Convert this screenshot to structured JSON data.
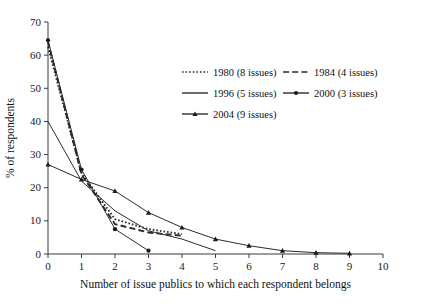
{
  "chart_data": {
    "type": "line",
    "title": "",
    "xlabel": "Number of issue publics to which each respondent belongs",
    "ylabel": "% of respondents",
    "xlim": [
      0,
      10
    ],
    "ylim": [
      0,
      70
    ],
    "xticks": [
      "0",
      "1",
      "2",
      "3",
      "4",
      "5",
      "6",
      "7",
      "8",
      "9",
      "10"
    ],
    "yticks": [
      "0",
      "10",
      "20",
      "30",
      "40",
      "50",
      "60",
      "70"
    ],
    "grid": false,
    "legend_position": "upper-center",
    "series": [
      {
        "name": "1980 (8 issues)",
        "label_year": "1980",
        "label_issues": "(8 issues)",
        "style": "dotted",
        "marker": "none",
        "color": "#2b2b2b",
        "x": [
          0,
          1,
          2,
          3,
          4
        ],
        "values": [
          62.5,
          24.5,
          10.5,
          7.5,
          6.0
        ]
      },
      {
        "name": "1984 (4 issues)",
        "label_year": "1984",
        "label_issues": "(4 issues)",
        "style": "dashed",
        "marker": "none",
        "color": "#2b2b2b",
        "x": [
          0,
          1,
          2,
          3,
          4
        ],
        "values": [
          64.0,
          24.0,
          9.0,
          6.5,
          5.5
        ]
      },
      {
        "name": "1996 (5 issues)",
        "label_year": "1996",
        "label_issues": "(5 issues)",
        "style": "solid",
        "marker": "none",
        "color": "#2b2b2b",
        "x": [
          0,
          1,
          2,
          3,
          4,
          5
        ],
        "values": [
          40.0,
          22.0,
          13.0,
          7.0,
          4.5,
          1.0
        ]
      },
      {
        "name": "2000 (3 issues)",
        "label_year": "2000",
        "label_issues": "(3 issues)",
        "style": "solid",
        "marker": "circle",
        "color": "#2b2b2b",
        "x": [
          0,
          1,
          2,
          3
        ],
        "values": [
          64.5,
          25.5,
          7.5,
          1.0
        ]
      },
      {
        "name": "2004 (9 issues)",
        "label_year": "2004",
        "label_issues": "(9 issues)",
        "style": "solid",
        "marker": "triangle",
        "color": "#2b2b2b",
        "x": [
          0,
          1,
          2,
          3,
          4,
          5,
          6,
          7,
          8,
          9
        ],
        "values": [
          27.0,
          22.5,
          19.0,
          12.5,
          8.0,
          4.5,
          2.5,
          1.0,
          0.4,
          0.2
        ]
      }
    ]
  },
  "legend": {
    "entries": [
      {
        "label": "1980 (8 issues)",
        "swatch": "dotted-line-swatch"
      },
      {
        "label": "1984 (4 issues)",
        "swatch": "dashed-line-swatch"
      },
      {
        "label": "1996 (5 issues)",
        "swatch": "solid-line-swatch"
      },
      {
        "label": "2000 (3 issues)",
        "swatch": "solid-circle-line-swatch"
      },
      {
        "label": "2004 (9 issues)",
        "swatch": "solid-triangle-line-swatch"
      }
    ]
  }
}
